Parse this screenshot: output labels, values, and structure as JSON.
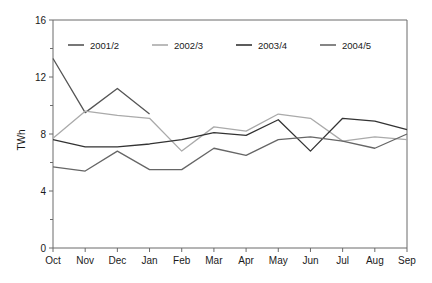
{
  "chart_data": {
    "type": "line",
    "title": "",
    "subtitle": "",
    "xlabel": "",
    "ylabel": "TWh",
    "categories": [
      "Oct",
      "Nov",
      "Dec",
      "Jan",
      "Feb",
      "Mar",
      "Apr",
      "May",
      "Jun",
      "Jul",
      "Aug",
      "Sep"
    ],
    "ylim": [
      0,
      16
    ],
    "yticks": [
      0,
      4,
      8,
      12,
      16
    ],
    "ytick_labels": [
      "0",
      "4",
      "8",
      "12",
      "16"
    ],
    "yminor_ticks": [
      2,
      6,
      10,
      14
    ],
    "grid": false,
    "legend_position": "top-inside",
    "series": [
      {
        "name": "2001/2",
        "color": "#555555",
        "values": [
          13.3,
          9.5,
          11.2,
          9.4,
          null,
          null,
          null,
          null,
          null,
          null,
          null,
          null
        ]
      },
      {
        "name": "2002/3",
        "color": "#aaaaaa",
        "values": [
          7.7,
          9.6,
          9.3,
          9.1,
          6.8,
          8.5,
          8.2,
          9.4,
          9.1,
          7.5,
          7.8,
          7.6
        ]
      },
      {
        "name": "2003/4",
        "color": "#333333",
        "values": [
          7.6,
          7.1,
          7.1,
          7.3,
          7.6,
          8.1,
          7.9,
          9.0,
          6.8,
          9.1,
          8.9,
          8.3
        ]
      },
      {
        "name": "2004/5",
        "color": "#666666",
        "values": [
          5.7,
          5.4,
          6.8,
          5.5,
          5.5,
          7.0,
          6.5,
          7.6,
          7.8,
          7.5,
          7.0,
          8.0
        ]
      }
    ]
  },
  "axes": {
    "y_axis_title": "TWh"
  },
  "legend": {
    "entries": [
      {
        "label": "2001/2"
      },
      {
        "label": "2002/3"
      },
      {
        "label": "2003/4"
      },
      {
        "label": "2004/5"
      }
    ]
  }
}
